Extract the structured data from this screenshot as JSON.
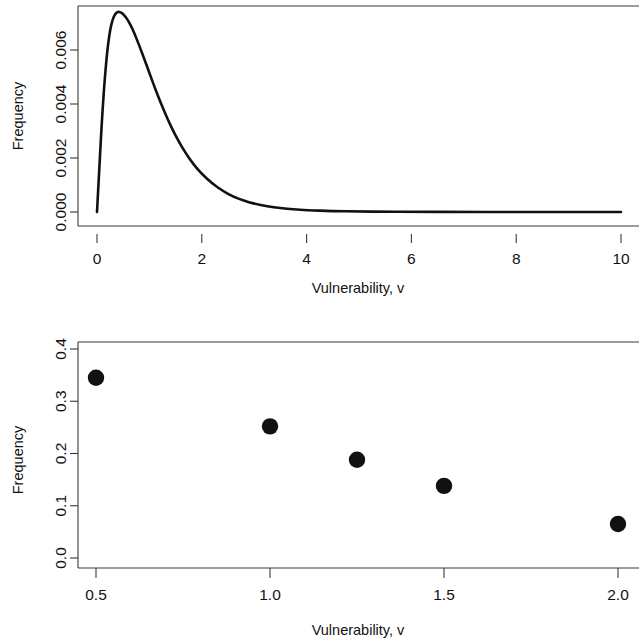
{
  "figure": {
    "panels": [
      {
        "id": "top-panel",
        "name": "gamma-density-curve",
        "chart_ref": 0
      },
      {
        "id": "bottom-panel",
        "name": "discrete-frequency-scatter",
        "chart_ref": 1
      }
    ]
  },
  "chart_data": [
    {
      "type": "line",
      "title": "",
      "xlabel": "Vulnerability, v",
      "ylabel": "Frequency",
      "xlim": [
        0,
        10
      ],
      "ylim": [
        0,
        0.0074
      ],
      "xticks": [
        0,
        2,
        4,
        6,
        8,
        10
      ],
      "xtick_labels": [
        "0",
        "2",
        "4",
        "6",
        "8",
        "10"
      ],
      "yticks": [
        0.0,
        0.002,
        0.004,
        0.006
      ],
      "ytick_labels": [
        "0.000",
        "0.002",
        "0.004",
        "0.006"
      ],
      "grid": false,
      "legend": null,
      "series": [
        {
          "name": "density",
          "x": [
            0.0,
            0.05,
            0.1,
            0.15,
            0.2,
            0.25,
            0.3,
            0.35,
            0.4,
            0.45,
            0.5,
            0.55,
            0.6,
            0.65,
            0.7,
            0.8,
            0.9,
            1.0,
            1.1,
            1.2,
            1.3,
            1.4,
            1.5,
            1.6,
            1.7,
            1.8,
            1.9,
            2.0,
            2.2,
            2.4,
            2.6,
            2.8,
            3.0,
            3.25,
            3.5,
            3.75,
            4.0,
            4.5,
            5.0,
            5.5,
            6.0,
            7.0,
            8.0,
            9.0,
            10.0
          ],
          "y": [
            0.0,
            0.00185,
            0.0036,
            0.005,
            0.00605,
            0.00675,
            0.00715,
            0.00735,
            0.00742,
            0.0074,
            0.00733,
            0.00722,
            0.00707,
            0.00689,
            0.00668,
            0.0062,
            0.00568,
            0.00515,
            0.00462,
            0.00412,
            0.00365,
            0.00322,
            0.00283,
            0.00248,
            0.00216,
            0.00188,
            0.00163,
            0.00141,
            0.00105,
            0.00078,
            0.00057,
            0.00042,
            0.00031,
            0.00021,
            0.00014,
            0.0001,
            7e-05,
            3e-05,
            2e-05,
            1e-05,
            1e-05,
            0.0,
            0.0,
            0.0,
            0.0
          ]
        }
      ]
    },
    {
      "type": "scatter",
      "title": "",
      "xlabel": "Vulnerability, v",
      "ylabel": "Frequency",
      "xlim": [
        0.43,
        2.08
      ],
      "ylim": [
        -0.012,
        0.415
      ],
      "xticks": [
        0.5,
        1.0,
        1.5,
        2.0
      ],
      "xtick_labels": [
        "0.5",
        "1.0",
        "1.5",
        "2.0"
      ],
      "yticks": [
        0.0,
        0.1,
        0.2,
        0.3,
        0.4
      ],
      "ytick_labels": [
        "0.0",
        "0.1",
        "0.2",
        "0.3",
        "0.4"
      ],
      "grid": false,
      "legend": null,
      "marker": "filled-circle",
      "series": [
        {
          "name": "observed frequency",
          "x": [
            0.5,
            1.0,
            1.25,
            1.5,
            2.0
          ],
          "y": [
            0.345,
            0.252,
            0.188,
            0.138,
            0.065
          ]
        }
      ]
    }
  ]
}
